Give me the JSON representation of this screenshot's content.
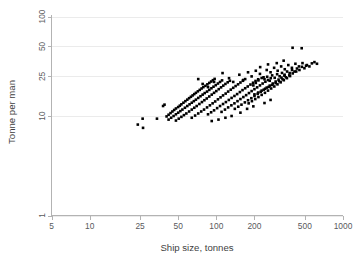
{
  "figure": {
    "background_color": "#ffffff",
    "marker_color": "#000000",
    "grid_color": "#ebebeb",
    "axis_color": "#b3b3b3",
    "text_color": "#59595c",
    "cropped_header_text": ""
  },
  "chart_data": {
    "type": "scatter",
    "title": "",
    "subtitle": "",
    "xlabel": "Ship size, tonnes",
    "ylabel": "Tonne per man",
    "xscale": "log",
    "yscale": "log",
    "xlim": [
      5,
      1000
    ],
    "ylim": [
      1,
      100
    ],
    "xticks": [
      5,
      10,
      25,
      50,
      100,
      200,
      500,
      1000
    ],
    "xticklabels": [
      "5",
      "10",
      "25",
      "50",
      "100",
      "200",
      "500",
      "1000"
    ],
    "yticks": [
      1,
      10,
      25,
      50,
      100
    ],
    "yticklabels": [
      "1",
      "10",
      "25",
      "50",
      "100"
    ],
    "grid": "horizontal",
    "grid_on": true,
    "legend": null,
    "legend_position": "none",
    "annotations": [],
    "marker": "square",
    "marker_size": 2.6,
    "n_points": 224,
    "points": [
      [
        24.0,
        8.2
      ],
      [
        26.2,
        9.4
      ],
      [
        26.4,
        7.6
      ],
      [
        34.0,
        9.4
      ],
      [
        38.0,
        12.6
      ],
      [
        39.0,
        13.0
      ],
      [
        40.5,
        9.9
      ],
      [
        42.0,
        10.3
      ],
      [
        43.5,
        10.7
      ],
      [
        45.0,
        11.1
      ],
      [
        46.5,
        11.5
      ],
      [
        48.0,
        11.9
      ],
      [
        50.0,
        12.3
      ],
      [
        51.5,
        12.7
      ],
      [
        53.0,
        13.1
      ],
      [
        55.0,
        13.6
      ],
      [
        57.0,
        14.1
      ],
      [
        59.0,
        14.6
      ],
      [
        61.0,
        15.1
      ],
      [
        63.0,
        15.6
      ],
      [
        65.0,
        16.1
      ],
      [
        67.0,
        16.6
      ],
      [
        69.0,
        17.1
      ],
      [
        71.5,
        17.7
      ],
      [
        74.0,
        18.3
      ],
      [
        76.5,
        18.9
      ],
      [
        79.0,
        19.5
      ],
      [
        82.0,
        20.1
      ],
      [
        85.0,
        20.8
      ],
      [
        88.0,
        21.5
      ],
      [
        91.0,
        22.2
      ],
      [
        94.0,
        22.9
      ],
      [
        97.0,
        23.6
      ],
      [
        42.0,
        9.2
      ],
      [
        44.0,
        9.6
      ],
      [
        46.0,
        10.0
      ],
      [
        48.0,
        10.4
      ],
      [
        50.0,
        10.8
      ],
      [
        52.0,
        11.2
      ],
      [
        54.0,
        11.6
      ],
      [
        56.5,
        12.1
      ],
      [
        59.0,
        12.6
      ],
      [
        61.5,
        13.1
      ],
      [
        64.0,
        13.6
      ],
      [
        66.5,
        14.1
      ],
      [
        69.0,
        14.6
      ],
      [
        72.0,
        15.2
      ],
      [
        75.0,
        15.8
      ],
      [
        78.0,
        16.4
      ],
      [
        81.0,
        17.0
      ],
      [
        84.5,
        17.6
      ],
      [
        88.0,
        18.3
      ],
      [
        91.5,
        19.0
      ],
      [
        95.0,
        19.7
      ],
      [
        99.0,
        20.4
      ],
      [
        103.0,
        21.2
      ],
      [
        107.0,
        22.0
      ],
      [
        111.0,
        22.8
      ],
      [
        48.0,
        9.0
      ],
      [
        50.5,
        9.4
      ],
      [
        53.0,
        9.8
      ],
      [
        55.5,
        10.2
      ],
      [
        58.0,
        10.6
      ],
      [
        61.0,
        11.1
      ],
      [
        64.0,
        11.6
      ],
      [
        67.0,
        12.1
      ],
      [
        70.0,
        12.6
      ],
      [
        73.5,
        13.2
      ],
      [
        77.0,
        13.8
      ],
      [
        80.5,
        14.4
      ],
      [
        84.0,
        15.0
      ],
      [
        88.0,
        15.7
      ],
      [
        92.0,
        16.4
      ],
      [
        96.0,
        17.1
      ],
      [
        100.0,
        17.8
      ],
      [
        104.5,
        18.6
      ],
      [
        109.0,
        19.4
      ],
      [
        113.5,
        20.2
      ],
      [
        118.0,
        21.0
      ],
      [
        123.0,
        21.8
      ],
      [
        128.0,
        22.6
      ],
      [
        64.0,
        9.6
      ],
      [
        68.0,
        10.1
      ],
      [
        72.0,
        10.6
      ],
      [
        76.0,
        11.1
      ],
      [
        80.0,
        11.6
      ],
      [
        84.5,
        12.2
      ],
      [
        89.0,
        12.8
      ],
      [
        93.5,
        13.4
      ],
      [
        98.0,
        14.0
      ],
      [
        103.0,
        14.7
      ],
      [
        108.0,
        15.4
      ],
      [
        113.0,
        16.1
      ],
      [
        118.5,
        16.8
      ],
      [
        124.0,
        17.6
      ],
      [
        130.0,
        18.4
      ],
      [
        136.0,
        19.2
      ],
      [
        142.0,
        20.0
      ],
      [
        148.5,
        20.8
      ],
      [
        155.0,
        21.7
      ],
      [
        162.0,
        22.6
      ],
      [
        169.0,
        23.5
      ],
      [
        86.0,
        10.4
      ],
      [
        91.0,
        10.9
      ],
      [
        96.0,
        11.4
      ],
      [
        101.5,
        12.0
      ],
      [
        107.0,
        12.6
      ],
      [
        113.0,
        13.2
      ],
      [
        119.0,
        13.8
      ],
      [
        125.5,
        14.5
      ],
      [
        132.0,
        15.2
      ],
      [
        139.0,
        15.9
      ],
      [
        146.0,
        16.6
      ],
      [
        153.5,
        17.4
      ],
      [
        161.0,
        18.2
      ],
      [
        169.0,
        19.0
      ],
      [
        177.0,
        19.8
      ],
      [
        186.0,
        20.7
      ],
      [
        195.0,
        21.6
      ],
      [
        204.0,
        22.5
      ],
      [
        214.0,
        23.4
      ],
      [
        110.0,
        11.0
      ],
      [
        117.0,
        11.6
      ],
      [
        124.0,
        12.2
      ],
      [
        131.5,
        12.8
      ],
      [
        139.0,
        13.4
      ],
      [
        147.0,
        14.1
      ],
      [
        155.0,
        14.8
      ],
      [
        163.5,
        15.5
      ],
      [
        172.0,
        16.2
      ],
      [
        181.0,
        17.0
      ],
      [
        190.0,
        17.8
      ],
      [
        200.0,
        18.6
      ],
      [
        210.0,
        19.4
      ],
      [
        221.0,
        20.3
      ],
      [
        232.0,
        21.2
      ],
      [
        244.0,
        22.1
      ],
      [
        256.0,
        23.0
      ],
      [
        269.0,
        24.0
      ],
      [
        140.0,
        11.8
      ],
      [
        149.0,
        12.4
      ],
      [
        158.0,
        13.0
      ],
      [
        168.0,
        13.7
      ],
      [
        178.0,
        14.4
      ],
      [
        189.0,
        15.1
      ],
      [
        200.0,
        15.9
      ],
      [
        212.0,
        16.7
      ],
      [
        224.0,
        17.5
      ],
      [
        237.0,
        18.4
      ],
      [
        250.0,
        19.3
      ],
      [
        264.0,
        20.2
      ],
      [
        279.0,
        21.2
      ],
      [
        294.0,
        22.2
      ],
      [
        310.0,
        23.2
      ],
      [
        327.0,
        24.3
      ],
      [
        345.0,
        25.4
      ],
      [
        180.0,
        13.4
      ],
      [
        191.0,
        14.1
      ],
      [
        203.0,
        14.8
      ],
      [
        215.0,
        15.5
      ],
      [
        228.0,
        16.3
      ],
      [
        242.0,
        17.1
      ],
      [
        256.0,
        18.0
      ],
      [
        271.0,
        18.9
      ],
      [
        287.0,
        19.8
      ],
      [
        304.0,
        20.8
      ],
      [
        322.0,
        21.8
      ],
      [
        341.0,
        22.9
      ],
      [
        361.0,
        24.0
      ],
      [
        382.0,
        25.2
      ],
      [
        200.0,
        16.5
      ],
      [
        214.0,
        17.2
      ],
      [
        228.0,
        18.0
      ],
      [
        243.0,
        18.8
      ],
      [
        259.0,
        19.6
      ],
      [
        276.0,
        20.5
      ],
      [
        294.0,
        21.4
      ],
      [
        313.0,
        22.4
      ],
      [
        333.0,
        23.4
      ],
      [
        354.0,
        24.5
      ],
      [
        377.0,
        25.6
      ],
      [
        401.0,
        26.8
      ],
      [
        427.0,
        28.0
      ],
      [
        196.0,
        20.3
      ],
      [
        205.0,
        21.5
      ],
      [
        215.0,
        22.8
      ],
      [
        228.0,
        24.1
      ],
      [
        240.0,
        23.4
      ],
      [
        252.0,
        24.8
      ],
      [
        264.0,
        22.6
      ],
      [
        276.0,
        25.6
      ],
      [
        289.0,
        24.2
      ],
      [
        302.0,
        26.3
      ],
      [
        316.0,
        25.1
      ],
      [
        330.0,
        27.1
      ],
      [
        346.0,
        26.0
      ],
      [
        362.0,
        28.0
      ],
      [
        379.0,
        27.0
      ],
      [
        396.0,
        29.0
      ],
      [
        414.0,
        28.0
      ],
      [
        433.0,
        30.0
      ],
      [
        453.0,
        29.0
      ],
      [
        474.0,
        31.2
      ],
      [
        496.0,
        30.2
      ],
      [
        519.0,
        32.5
      ],
      [
        543.0,
        31.5
      ],
      [
        568.0,
        33.8
      ],
      [
        595.0,
        34.8
      ],
      [
        623.0,
        33.5
      ],
      [
        112.0,
        27.0
      ],
      [
        126.0,
        24.0
      ],
      [
        136.0,
        22.0
      ],
      [
        152.0,
        26.0
      ],
      [
        163.0,
        23.0
      ],
      [
        178.0,
        27.5
      ],
      [
        190.0,
        25.0
      ],
      [
        205.0,
        28.5
      ],
      [
        221.0,
        26.5
      ],
      [
        236.0,
        24.5
      ],
      [
        250.0,
        29.0
      ],
      [
        268.0,
        27.5
      ],
      [
        286.0,
        30.5
      ],
      [
        305.0,
        28.5
      ],
      [
        325.0,
        31.5
      ],
      [
        347.0,
        29.5
      ],
      [
        370.0,
        32.5
      ],
      [
        395.0,
        30.5
      ],
      [
        421.0,
        33.5
      ],
      [
        449.0,
        31.5
      ],
      [
        479.0,
        34.0
      ],
      [
        511.0,
        32.0
      ],
      [
        72.0,
        23.5
      ],
      [
        78.0,
        21.0
      ],
      [
        86.0,
        19.5
      ],
      [
        96.0,
        22.0
      ],
      [
        400.0,
        48.5
      ],
      [
        472.0,
        48.0
      ],
      [
        300.0,
        34.0
      ],
      [
        340.0,
        36.0
      ],
      [
        256.0,
        33.0
      ],
      [
        222.0,
        31.0
      ],
      [
        240.0,
        13.5
      ],
      [
        268.0,
        14.5
      ],
      [
        196.0,
        12.5
      ],
      [
        175.0,
        11.8
      ],
      [
        155.0,
        10.8
      ],
      [
        132.0,
        10.0
      ],
      [
        118.0,
        9.6
      ],
      [
        104.0,
        9.2
      ],
      [
        92.0,
        8.9
      ]
    ]
  }
}
